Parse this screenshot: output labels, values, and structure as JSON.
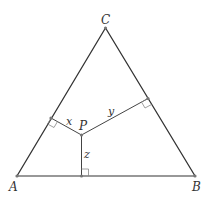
{
  "diagram": {
    "type": "geometry",
    "vertices": {
      "A": {
        "label": "A",
        "x": 17,
        "y": 176
      },
      "B": {
        "label": "B",
        "x": 195,
        "y": 176
      },
      "C": {
        "label": "C",
        "x": 105.5,
        "y": 28
      }
    },
    "point": {
      "label": "P",
      "x": 81.5,
      "y": 135
    },
    "feet": {
      "AC": {
        "x": 51,
        "y": 118
      },
      "BC": {
        "x": 148,
        "y": 98.5
      },
      "AB": {
        "x": 81.5,
        "y": 176
      }
    },
    "segments": {
      "x": {
        "label": "x"
      },
      "y": {
        "label": "y"
      },
      "z": {
        "label": "z"
      }
    },
    "colors": {
      "stroke": "#333333",
      "right_angle": "#888888",
      "point": "#777777"
    }
  }
}
